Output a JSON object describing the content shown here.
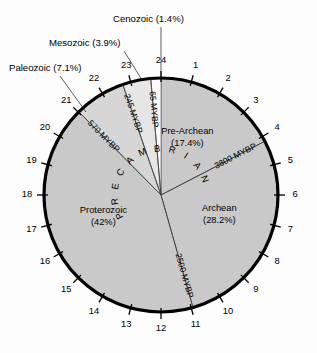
{
  "figure": {
    "center": {
      "x": 161,
      "y": 195
    },
    "radius": 117
  },
  "chart_data": {
    "type": "pie",
    "xlabel": "",
    "ylabel": "",
    "legend_position": "callouts",
    "grid": false,
    "units": "percent of Earth history",
    "dial_hours": 24,
    "categories": [
      "Pre-Archean",
      "Archean",
      "Proterozoic",
      "Paleozoic",
      "Mesozoic",
      "Cenozoic"
    ],
    "values": [
      17.4,
      28.2,
      42.0,
      7.1,
      3.9,
      1.4
    ],
    "colors": [
      "#c9c9c9",
      "#c9c9c9",
      "#c9c9c9",
      "#d8d8d8",
      "#e8e8e8",
      "#fbfbfb"
    ],
    "boundaries_mybp": [
      3800,
      2500,
      570,
      245,
      65
    ],
    "annotations": [
      "PRECAMBRIAN"
    ]
  },
  "wedges": [
    {
      "name": "Pre-Archean",
      "label": "Pre-Archean",
      "percent_label": "(17.4%)",
      "percent": 17.4,
      "start_pct": 0.0,
      "end_pct": 17.4,
      "fill": "#c9c9c9",
      "label_r": 62,
      "label_angle_pct": 7.0,
      "inside": true
    },
    {
      "name": "Archean",
      "label": "Archean",
      "percent_label": "(28.2%)",
      "percent": 28.2,
      "start_pct": 17.4,
      "end_pct": 45.6,
      "fill": "#c9c9c9",
      "label_r": 62,
      "label_angle_pct": 30.5,
      "inside": true
    },
    {
      "name": "Proterozoic",
      "label": "Proterozoic",
      "percent_label": "(42%)",
      "percent": 42.0,
      "start_pct": 45.6,
      "end_pct": 87.6,
      "fill": "#c9c9c9",
      "label_r": 62,
      "label_angle_pct": 69.0,
      "inside": true
    },
    {
      "name": "Paleozoic",
      "label": "Paleozoic (7.1%)",
      "percent_label": "(7.1%)",
      "percent": 7.1,
      "start_pct": 87.6,
      "end_pct": 94.7,
      "fill": "#d6d6d6",
      "inside": false
    },
    {
      "name": "Mesozoic",
      "label": "Mesozoic (3.9%)",
      "percent_label": "(3.9%)",
      "percent": 3.9,
      "start_pct": 94.7,
      "end_pct": 98.6,
      "fill": "#e6e6e6",
      "inside": false
    },
    {
      "name": "Cenozoic",
      "label": "Cenozoic (1.4%)",
      "percent_label": "(1.4%)",
      "percent": 1.4,
      "start_pct": 98.6,
      "end_pct": 100.0,
      "fill": "#fbfbfb",
      "inside": false
    }
  ],
  "callouts": [
    {
      "name": "paleozoic-callout",
      "text": "Paleozoic (7.1%)",
      "text_x": 9,
      "text_y": 71,
      "anchor": "start",
      "leader": [
        [
          60,
          76
        ],
        [
          86,
          112
        ]
      ]
    },
    {
      "name": "mesozoic-callout",
      "text": "Mesozoic (3.9%)",
      "text_x": 49,
      "text_y": 46,
      "anchor": "start",
      "leader": [
        [
          124,
          51
        ],
        [
          142,
          80
        ]
      ]
    },
    {
      "name": "cenozoic-callout",
      "text": "Cenozoic (1.4%)",
      "text_x": 113,
      "text_y": 22,
      "anchor": "start",
      "leader": [
        [
          161,
          27
        ],
        [
          161,
          79
        ]
      ]
    }
  ],
  "boundary_lines": [
    {
      "name": "boundary-3800",
      "label": "3800 MYBP",
      "at_pct": 17.4,
      "label_r": 84,
      "flip": false
    },
    {
      "name": "boundary-2500",
      "label": "2500 MYBP",
      "at_pct": 45.6,
      "label_r": 84,
      "flip": false
    },
    {
      "name": "boundary-570",
      "label": "570 MYBP",
      "at_pct": 87.6,
      "label_r": 82,
      "flip": false
    },
    {
      "name": "boundary-245",
      "label": "245 MYBP",
      "at_pct": 94.7,
      "label_r": 86,
      "flip": false
    },
    {
      "name": "boundary-65",
      "label": "65 MYBP",
      "at_pct": 98.6,
      "label_r": 86,
      "flip": false
    }
  ],
  "hour_marks": {
    "count": 24,
    "labels": [
      "1",
      "2",
      "3",
      "4",
      "5",
      "6",
      "7",
      "8",
      "9",
      "10",
      "11",
      "12",
      "13",
      "14",
      "15",
      "16",
      "17",
      "18",
      "19",
      "20",
      "21",
      "22",
      "23",
      "24"
    ],
    "tick_inner_r": 113,
    "tick_outer_r": 124,
    "label_r": 134
  },
  "precambrian": {
    "text": "PRECAMBRIAN",
    "chars": [
      "P",
      "R",
      "E",
      "C",
      "A",
      "M",
      "B",
      "R",
      "I",
      "A",
      "N"
    ],
    "radius": 46,
    "start_pct": 65.0,
    "end_pct": 22.0
  }
}
